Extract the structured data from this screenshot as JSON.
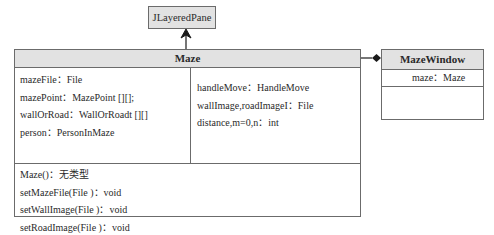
{
  "diagram_type": "UML class diagram",
  "classes": {
    "parent": {
      "name": "JLayeredPane"
    },
    "maze": {
      "name": "Maze",
      "attributes_left": [
        "mazeFile：File",
        "mazePoint：MazePoint [][];",
        "wallOrRoad：WallOrRoadt [][]",
        "person：PersonInMaze"
      ],
      "attributes_right": [
        "handleMove：HandleMove",
        "wallImage,roadImageI：File",
        "distance,m=0,n：int"
      ],
      "methods": [
        "Maze()：无类型",
        "setMazeFile(File )：void",
        "setWallImage(File )：void",
        "setRoadImage(File )：void",
        "getHandleMove()：HandleMove"
      ]
    },
    "window": {
      "name": "MazeWindow",
      "attributes": [
        "maze：Maze"
      ]
    }
  },
  "relationships": [
    {
      "type": "inheritance",
      "from": "Maze",
      "to": "JLayeredPane"
    },
    {
      "type": "composition",
      "from": "MazeWindow",
      "to": "Maze"
    }
  ],
  "colors": {
    "header_fill": "#e2e2e2",
    "border": "#6b6b6b",
    "text": "#2a2a2a",
    "connector": "#1a1a1a"
  }
}
